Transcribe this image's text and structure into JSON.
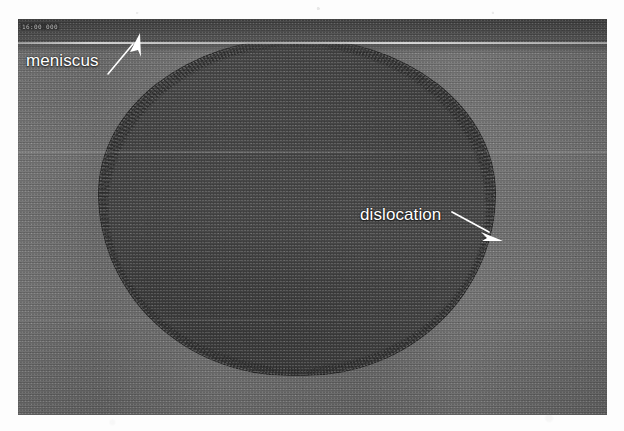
{
  "figure": {
    "kind": "micrograph"
  },
  "micrograph": {
    "instrument_stamp": "16:00 000",
    "top_band": {
      "name": "meniscus-band",
      "color": "#474747"
    },
    "matrix": {
      "name": "melt-matrix",
      "color": "#6a6a6a"
    },
    "dark_region": {
      "name": "dislocated-crystal-region",
      "color": "#3a3a3a"
    }
  },
  "annotations": [
    {
      "id": "meniscus",
      "label": "meniscus",
      "arrow_from": [
        112,
        68
      ],
      "arrow_to": [
        139,
        38
      ],
      "color": "#ffffff"
    },
    {
      "id": "dislocation",
      "label": "dislocation",
      "arrow_from": [
        455,
        213
      ],
      "arrow_to": [
        500,
        240
      ],
      "color": "#ffffff"
    }
  ],
  "colors": {
    "page_background": "#fdfdfd",
    "matrix_gray": "#6a6a6a",
    "dark_gray": "#3a3a3a",
    "band_gray": "#474747",
    "annotation_white": "#ffffff"
  }
}
